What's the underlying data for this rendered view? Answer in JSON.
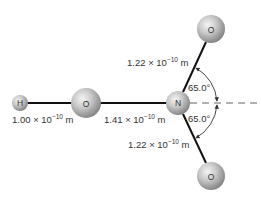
{
  "diagram": {
    "molecule": "HONO2",
    "atoms": [
      {
        "id": "h",
        "symbol": "H"
      },
      {
        "id": "o1",
        "symbol": "O"
      },
      {
        "id": "n",
        "symbol": "N"
      },
      {
        "id": "o2",
        "symbol": "O"
      },
      {
        "id": "o3",
        "symbol": "O"
      }
    ],
    "bond_lengths": [
      {
        "mantissa": "1.00 × 10",
        "exponent": "−10",
        "unit": " m",
        "between": "H–O"
      },
      {
        "mantissa": "1.41 × 10",
        "exponent": "−10",
        "unit": " m",
        "between": "O–N"
      },
      {
        "mantissa": "1.22 × 10",
        "exponent": "−10",
        "unit": " m",
        "between": "N–O (upper)"
      },
      {
        "mantissa": "1.22 × 10",
        "exponent": "−10",
        "unit": " m",
        "between": "N–O (lower)"
      }
    ],
    "angles": [
      {
        "label": "65.0°",
        "position": "upper"
      },
      {
        "label": "65.0°",
        "position": "lower"
      }
    ],
    "colors": {
      "bond": "#111111",
      "atom_light": "#eeeeee",
      "atom_dark": "#8a8a8a",
      "dashed_axis": "#666666",
      "text": "#333333"
    }
  }
}
